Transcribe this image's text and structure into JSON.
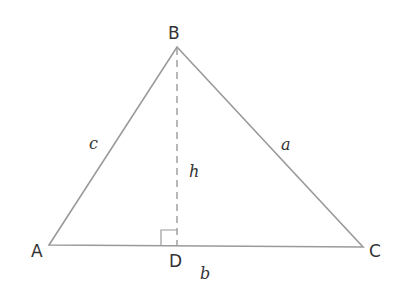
{
  "diagram": {
    "type": "triangle-with-altitude",
    "colors": {
      "line": "#9a9a9a",
      "text": "#333333",
      "background": "#ffffff"
    },
    "vertices": [
      {
        "id": "A",
        "label": "A",
        "x": 49,
        "y": 245
      },
      {
        "id": "B",
        "label": "B",
        "x": 177,
        "y": 47
      },
      {
        "id": "C",
        "label": "C",
        "x": 363,
        "y": 247
      },
      {
        "id": "D",
        "label": "D",
        "x": 177,
        "y": 246
      }
    ],
    "sides": [
      {
        "id": "a",
        "label": "a",
        "from": "B",
        "to": "C"
      },
      {
        "id": "b",
        "label": "b",
        "from": "A",
        "to": "C"
      },
      {
        "id": "c",
        "label": "c",
        "from": "A",
        "to": "B"
      }
    ],
    "altitude": {
      "label": "h",
      "from": "B",
      "to": "D",
      "style": "dashed"
    },
    "right_angle_marker": {
      "at": "D"
    }
  }
}
